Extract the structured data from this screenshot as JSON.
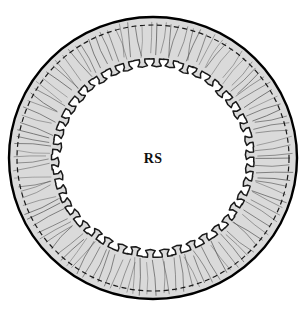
{
  "figure": {
    "domain": "Diagram",
    "kind": "annular-cross-section-line-drawing",
    "caption_label": "RS",
    "background_color": "#ffffff",
    "canvas": {
      "width": 307,
      "height": 315
    }
  },
  "labels": {
    "center_label": {
      "text": "RS",
      "x": 153,
      "y": 160,
      "font_weight": "bold",
      "font_size_px": 14,
      "color": "#101010"
    }
  },
  "geometry": {
    "center_x": 153,
    "center_y": 158,
    "outer_radius_x": 144,
    "outer_radius_y": 141,
    "dashed_radius_x": 136,
    "dashed_radius_y": 133,
    "inner_base_radius_x": 101,
    "inner_base_radius_y": 99,
    "tooth_count": 42,
    "tooth_head_radius_x": 94,
    "tooth_head_radius_y": 92,
    "tooth_neck_half_angle_deg": 1.55,
    "tooth_head_half_angle_deg": 2.9,
    "radial_line_count": 118,
    "rotation_offset_deg": -88
  },
  "colors": {
    "outline_stroke": "#000000",
    "band_fill": "#dadada",
    "band_fill_light": "#e6e6e6",
    "inner_outline_stroke": "#1a1a1a",
    "dashed_stroke": "#1a1a1a",
    "radial_line_stroke": "#555555",
    "center_fill": "#ffffff",
    "label_color": "#101010"
  },
  "strokes": {
    "outer_circle_width": 2.4,
    "inner_scallop_width": 1.5,
    "dashed_width": 1.2,
    "dashed_pattern": "5,3.5",
    "radial_line_width": 0.75
  },
  "structure_parts": [
    {
      "name": "outer-boundary",
      "description": "solid black outer circle",
      "interactable": false
    },
    {
      "name": "dashed-inner-boundary",
      "description": "dashed circle just inside outer boundary",
      "interactable": false
    },
    {
      "name": "gray-band",
      "description": "light gray filled annular band",
      "interactable": false
    },
    {
      "name": "radial-lines",
      "description": "thin radial striations across band",
      "interactable": false
    },
    {
      "name": "crenulated-margin",
      "description": "inner scalloped margin of nail-shaped teeth",
      "interactable": false
    },
    {
      "name": "central-lumen",
      "description": "white central region labelled RS",
      "interactable": false
    }
  ],
  "chart_data": {
    "type": "diagram",
    "title": "",
    "annotations": [
      "RS"
    ],
    "element_counts": {
      "teeth": 42,
      "radial_lines": 118,
      "concentric_boundaries": 3
    }
  }
}
